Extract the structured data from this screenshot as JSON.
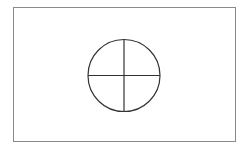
{
  "diagram": {
    "type": "circle-with-cross",
    "frame_color": "#8a8a8a",
    "stroke_color": "#333333",
    "circle": {
      "cx": 124,
      "cy": 75,
      "r": 36.5
    }
  }
}
